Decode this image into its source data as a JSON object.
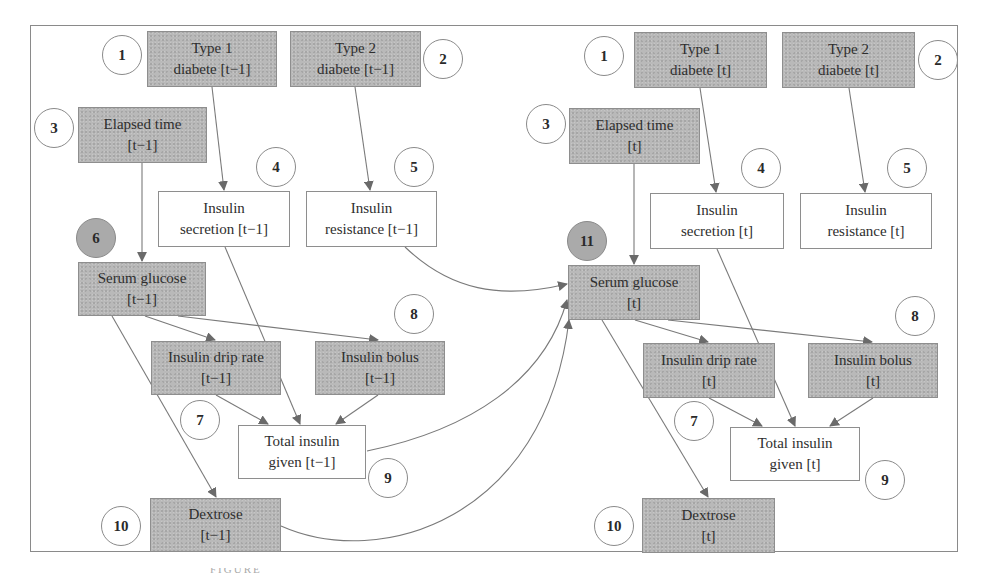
{
  "diagram": {
    "type": "dynamic-bayesian-network",
    "slices": [
      {
        "id": "prev",
        "nodes": {
          "type1": {
            "line1": "Type 1",
            "line2": "diabete [t−1]",
            "observed": true,
            "badge": "1"
          },
          "type2": {
            "line1": "Type 2",
            "line2": "diabete [t−1]",
            "observed": true,
            "badge": "2"
          },
          "elapsed": {
            "line1": "Elapsed time",
            "line2": "[t−1]",
            "observed": true,
            "badge": "3"
          },
          "secretion": {
            "line1": "Insulin",
            "line2": "secretion [t−1]",
            "observed": false,
            "badge": "4"
          },
          "resistance": {
            "line1": "Insulin",
            "line2": "resistance [t−1]",
            "observed": false,
            "badge": "5"
          },
          "glucose": {
            "line1": "Serum glucose",
            "line2": "[t−1]",
            "observed": true,
            "badge": "6"
          },
          "drip": {
            "line1": "Insulin drip rate",
            "line2": "[t−1]",
            "observed": true,
            "badge": "7"
          },
          "bolus": {
            "line1": "Insulin bolus",
            "line2": "[t−1]",
            "observed": true,
            "badge": "8"
          },
          "total": {
            "line1": "Total insulin",
            "line2": "given [t−1]",
            "observed": false,
            "badge": "9"
          },
          "dextrose": {
            "line1": "Dextrose",
            "line2": "[t−1]",
            "observed": true,
            "badge": "10"
          }
        }
      },
      {
        "id": "curr",
        "nodes": {
          "type1": {
            "line1": "Type 1",
            "line2": "diabete [t]",
            "observed": true,
            "badge": "1"
          },
          "type2": {
            "line1": "Type 2",
            "line2": "diabete [t]",
            "observed": true,
            "badge": "2"
          },
          "elapsed": {
            "line1": "Elapsed time",
            "line2": "[t]",
            "observed": true,
            "badge": "3"
          },
          "secretion": {
            "line1": "Insulin",
            "line2": "secretion [t]",
            "observed": false,
            "badge": "4"
          },
          "resistance": {
            "line1": "Insulin",
            "line2": "resistance [t]",
            "observed": false,
            "badge": "5"
          },
          "glucose": {
            "line1": "Serum glucose",
            "line2": "[t]",
            "observed": true,
            "badge": "11"
          },
          "drip": {
            "line1": "Insulin drip rate",
            "line2": "[t]",
            "observed": true,
            "badge": "7"
          },
          "bolus": {
            "line1": "Insulin bolus",
            "line2": "[t]",
            "observed": true,
            "badge": "8"
          },
          "total": {
            "line1": "Total insulin",
            "line2": "given [t]",
            "observed": false,
            "badge": "9"
          },
          "dextrose": {
            "line1": "Dextrose",
            "line2": "[t]",
            "observed": true,
            "badge": "10"
          }
        }
      }
    ],
    "intra_slice_edges": [
      [
        "type1",
        "secretion"
      ],
      [
        "type2",
        "resistance"
      ],
      [
        "elapsed",
        "glucose"
      ],
      [
        "glucose",
        "drip"
      ],
      [
        "glucose",
        "bolus"
      ],
      [
        "glucose",
        "dextrose"
      ],
      [
        "secretion",
        "total"
      ],
      [
        "drip",
        "total"
      ],
      [
        "bolus",
        "total"
      ]
    ],
    "inter_slice_edges": [
      [
        "prev.resistance",
        "curr.glucose"
      ],
      [
        "prev.total",
        "curr.glucose"
      ],
      [
        "prev.dextrose",
        "curr.glucose"
      ]
    ],
    "colors": {
      "observed_fill": "#b9b9b9",
      "latent_fill": "#ffffff",
      "edge": "#707070",
      "highlight_badge": "#aaaaaa"
    }
  },
  "caption": "FIGURE"
}
